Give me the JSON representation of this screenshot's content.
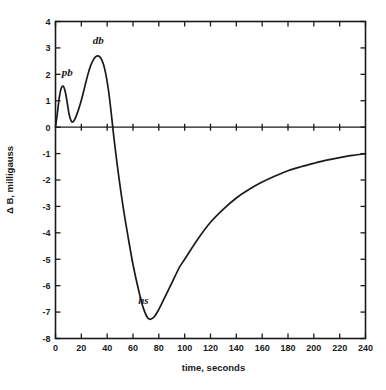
{
  "chart_data": {
    "type": "line",
    "title": "",
    "xlabel": "time, seconds",
    "ylabel": "Δ B, milligauss",
    "xlim": [
      0,
      240
    ],
    "ylim": [
      -8,
      4
    ],
    "grid": false,
    "legend": null,
    "zero_reference_line": true,
    "xticks": [
      0,
      20,
      40,
      60,
      80,
      100,
      120,
      140,
      160,
      180,
      200,
      220,
      240
    ],
    "xtick_labels": [
      "0",
      "20",
      "40",
      "60",
      "80",
      "100",
      "120",
      "140",
      "160",
      "180",
      "200",
      "220",
      "240"
    ],
    "yticks": [
      -8,
      -7,
      -6,
      -5,
      -4,
      -3,
      -2,
      -1,
      0,
      1,
      2,
      3,
      4
    ],
    "ytick_labels": [
      "-8",
      "-7",
      "-6",
      "-5",
      "-4",
      "-3",
      "-2",
      "-1",
      "0",
      "1",
      "2",
      "3",
      "4"
    ],
    "annotations": [
      {
        "label": "pb",
        "x": 6,
        "y": 1.55,
        "label_x": 9,
        "label_y": 1.95
      },
      {
        "label": "db",
        "x": 33,
        "y": 2.7,
        "label_x": 33,
        "label_y": 3.15
      },
      {
        "label": "hs",
        "x": 72,
        "y": -7.25,
        "label_x": 68,
        "label_y": -6.7
      }
    ],
    "series": [
      {
        "name": "delta-B",
        "x": [
          0,
          1.5,
          3,
          4.5,
          6,
          7.5,
          9,
          10.5,
          12,
          13.5,
          15,
          17,
          19,
          21,
          23,
          25,
          27,
          29,
          31,
          33,
          35,
          37,
          39,
          41,
          43,
          45,
          48,
          52,
          56,
          60,
          64,
          68,
          72,
          76,
          80,
          84,
          88,
          92,
          96,
          100,
          110,
          120,
          130,
          140,
          150,
          160,
          170,
          180,
          190,
          200,
          210,
          220,
          230,
          240
        ],
        "y": [
          0.0,
          0.55,
          1.15,
          1.48,
          1.55,
          1.35,
          0.95,
          0.5,
          0.25,
          0.2,
          0.3,
          0.55,
          0.85,
          1.2,
          1.6,
          1.98,
          2.3,
          2.52,
          2.66,
          2.7,
          2.62,
          2.4,
          2.0,
          1.4,
          0.6,
          -0.3,
          -1.5,
          -2.9,
          -4.1,
          -5.2,
          -6.1,
          -6.85,
          -7.25,
          -7.2,
          -6.9,
          -6.5,
          -6.1,
          -5.7,
          -5.3,
          -5.0,
          -4.25,
          -3.6,
          -3.1,
          -2.68,
          -2.35,
          -2.08,
          -1.85,
          -1.65,
          -1.5,
          -1.37,
          -1.25,
          -1.15,
          -1.07,
          -1.0
        ]
      }
    ]
  },
  "figure": {
    "background_color": "#ffffff",
    "line_color": "#1a1a1a",
    "text_color": "#1a1a1a"
  }
}
